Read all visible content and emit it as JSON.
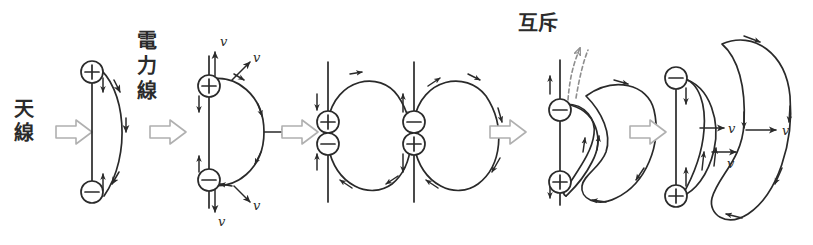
{
  "figure": {
    "title_present": false,
    "background_color": "#ffffff",
    "ink_color": "#2a2a2a",
    "accent_gray": "#b0b0b0",
    "width": 813,
    "height": 245
  },
  "labels": {
    "antenna": "天線",
    "field_line": "電力線",
    "repulsion": "互斥",
    "velocity": "v",
    "plus": "+",
    "minus": "−"
  },
  "stages": [
    {
      "id": "stage-1",
      "name": "dipole-with-attached-field-line",
      "caption": "天線",
      "charges": [
        {
          "sign": "+",
          "position": "top"
        },
        {
          "sign": "−",
          "position": "bottom"
        }
      ],
      "velocity_labels": [],
      "field_lines": 1,
      "notes": "電力線"
    },
    {
      "id": "stage-2",
      "name": "field-line-expanding-outward",
      "caption": "電力線",
      "charges": [
        {
          "sign": "+",
          "position": "top"
        },
        {
          "sign": "−",
          "position": "bottom"
        }
      ],
      "velocity_labels": [
        "v",
        "v",
        "v",
        "v",
        "v"
      ],
      "field_lines": 1
    },
    {
      "id": "stage-3",
      "name": "charges-merging-loop-closing",
      "caption": "",
      "charges": [
        {
          "sign": "+",
          "position": "upper"
        },
        {
          "sign": "−",
          "position": "lower"
        }
      ],
      "velocity_labels": [],
      "field_lines": 1
    },
    {
      "id": "stage-3b",
      "name": "charges-reversed-loop-closing",
      "caption": "",
      "charges": [
        {
          "sign": "−",
          "position": "upper"
        },
        {
          "sign": "+",
          "position": "lower"
        }
      ],
      "velocity_labels": [],
      "field_lines": 1
    },
    {
      "id": "stage-4",
      "name": "loops-repelling-detaching",
      "caption": "互斥",
      "charges": [
        {
          "sign": "−",
          "position": "top"
        },
        {
          "sign": "+",
          "position": "bottom"
        }
      ],
      "velocity_labels": [],
      "field_lines": 2,
      "dashed_arrow": true
    },
    {
      "id": "stage-5",
      "name": "detached-waves-propagating",
      "caption": "",
      "charges": [
        {
          "sign": "−",
          "position": "top"
        },
        {
          "sign": "+",
          "position": "bottom"
        }
      ],
      "velocity_labels": [
        "v",
        "v",
        "v"
      ],
      "field_lines": 2
    }
  ],
  "transitions": [
    {
      "id": "arrow-1",
      "name": "stage-arrow",
      "glyph": "⇒"
    },
    {
      "id": "arrow-2",
      "name": "stage-arrow",
      "glyph": "⇒"
    },
    {
      "id": "arrow-3",
      "name": "stage-arrow",
      "glyph": "⇒"
    },
    {
      "id": "arrow-4",
      "name": "stage-arrow",
      "glyph": "⇒"
    },
    {
      "id": "arrow-5",
      "name": "stage-arrow",
      "glyph": "⇒"
    }
  ]
}
